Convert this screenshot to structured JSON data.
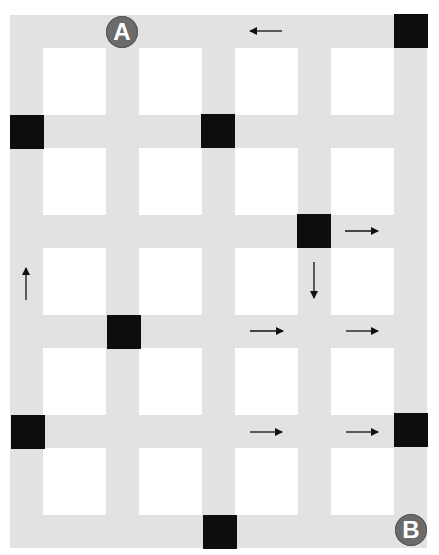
{
  "colors": {
    "road": "#e2e2e2",
    "background": "#ffffff",
    "blocked": "#0d0d0d",
    "marker": "#6b6b6b",
    "arrow": "#111111"
  },
  "grid": {
    "columns_x": [
      10,
      106,
      202,
      298,
      394
    ],
    "rows_y": [
      15,
      115,
      215,
      315,
      415,
      515
    ],
    "road_width": 33
  },
  "markers": [
    {
      "label": "A",
      "name": "start-marker-a",
      "x": 106,
      "y": 16
    },
    {
      "label": "B",
      "name": "end-marker-b",
      "x": 395,
      "y": 514
    }
  ],
  "blocked_intersections": [
    {
      "x": 394,
      "y": 14
    },
    {
      "x": 10,
      "y": 115
    },
    {
      "x": 201,
      "y": 114
    },
    {
      "x": 297,
      "y": 214
    },
    {
      "x": 107,
      "y": 315
    },
    {
      "x": 11,
      "y": 415
    },
    {
      "x": 394,
      "y": 413
    },
    {
      "x": 203,
      "y": 515
    }
  ],
  "arrows": [
    {
      "direction": "left",
      "x1": 282,
      "y1": 31,
      "x2": 250,
      "y2": 31
    },
    {
      "direction": "right",
      "x1": 345,
      "y1": 231,
      "x2": 378,
      "y2": 231
    },
    {
      "direction": "down",
      "x1": 314,
      "y1": 262,
      "x2": 314,
      "y2": 298
    },
    {
      "direction": "up",
      "x1": 26,
      "y1": 300,
      "x2": 26,
      "y2": 268
    },
    {
      "direction": "right",
      "x1": 250,
      "y1": 331,
      "x2": 283,
      "y2": 331
    },
    {
      "direction": "right",
      "x1": 346,
      "y1": 331,
      "x2": 378,
      "y2": 331
    },
    {
      "direction": "right",
      "x1": 250,
      "y1": 432,
      "x2": 282,
      "y2": 432
    },
    {
      "direction": "right",
      "x1": 346,
      "y1": 432,
      "x2": 378,
      "y2": 432
    }
  ]
}
